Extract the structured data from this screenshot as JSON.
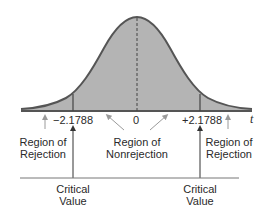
{
  "diagram": {
    "type": "two-tailed t-test rejection regions",
    "axis": {
      "variable_label": "t",
      "ticks": [
        "−2.1788",
        "0",
        "+2.1788"
      ]
    },
    "regions": {
      "left_rejection": {
        "line1": "Region of",
        "line2": "Rejection"
      },
      "nonrejection": {
        "line1": "Region of",
        "line2": "Nonrejection"
      },
      "right_rejection": {
        "line1": "Region of",
        "line2": "Rejection"
      }
    },
    "critical_values": {
      "left": {
        "line1": "Critical",
        "line2": "Value"
      },
      "right": {
        "line1": "Critical",
        "line2": "Value"
      }
    },
    "colors": {
      "curve_fill": "#b4b4b4",
      "curve_stroke": "#555555",
      "text": "#2a2a2a",
      "arrow_gray": "#9a9a9a"
    }
  }
}
